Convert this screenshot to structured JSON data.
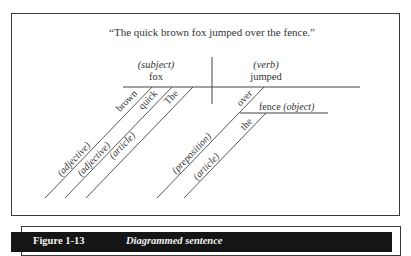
{
  "figure": {
    "number": "Figure 1-13",
    "title": "Diagrammed sentence"
  },
  "diagram": {
    "sentence": "“The quick brown fox jumped over the fence.”",
    "subject": {
      "role": "(subject)",
      "word": "fox"
    },
    "verb": {
      "role": "(verb)",
      "word": "jumped"
    },
    "modifiers": [
      {
        "word": "brown",
        "role": "(adjective)"
      },
      {
        "word": "quick",
        "role": "(adjective)"
      },
      {
        "word": "The",
        "role": "(article)"
      }
    ],
    "prepositional_phrase": {
      "preposition": {
        "word": "over",
        "role": "(preposition)"
      },
      "object": {
        "word": "fence",
        "role": "(object)"
      },
      "article": {
        "word": "the",
        "role": "(article)"
      }
    }
  }
}
